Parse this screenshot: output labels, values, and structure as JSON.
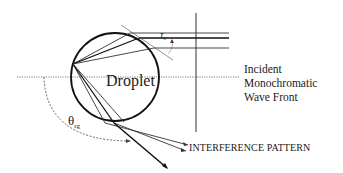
{
  "diagram": {
    "droplet_label": "Droplet",
    "incident_lines": [
      "Incident",
      "Monochromatic",
      "Wave Front"
    ],
    "interference_label": "INTERFERENCE PATTERN",
    "theta_symbol": "θ",
    "theta_subscript": "rg",
    "tau_symbol": "τ",
    "tau_subscript": "s",
    "colors": {
      "line": "#1a1a1a",
      "thin_line": "#444444",
      "background": "#ffffff"
    }
  }
}
